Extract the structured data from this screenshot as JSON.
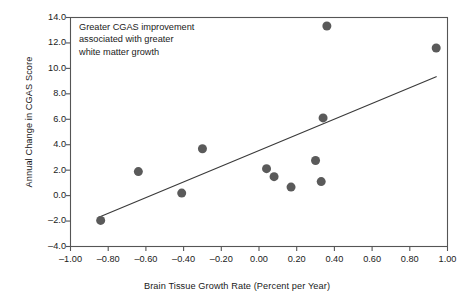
{
  "chart_data": {
    "type": "scatter",
    "title": "",
    "xlabel": "Brain Tissue Growth Rate (Percent per Year)",
    "ylabel": "Annual Change in CGAS Score",
    "xlim": [
      -1.0,
      1.0
    ],
    "ylim": [
      -4.0,
      14.0
    ],
    "xticks": [
      "-1.00",
      "-0.80",
      "-0.60",
      "-0.40",
      "-0.20",
      "0.00",
      "0.20",
      "0.40",
      "0.60",
      "0.80",
      "1.00"
    ],
    "xtick_values": [
      -1.0,
      -0.8,
      -0.6,
      -0.4,
      -0.2,
      0.0,
      0.2,
      0.4,
      0.6,
      0.8,
      1.0
    ],
    "yticks": [
      "-4.0",
      "-2.0",
      "0.0",
      "2.0",
      "4.0",
      "6.0",
      "8.0",
      "10.0",
      "12.0",
      "14.0"
    ],
    "ytick_values": [
      -4.0,
      -2.0,
      0.0,
      2.0,
      4.0,
      6.0,
      8.0,
      10.0,
      12.0,
      14.0
    ],
    "grid": false,
    "legend": false,
    "annotation": "Greater CGAS improvement\nassociated with greater\nwhite matter growth",
    "marker_color": "#5a5a5a",
    "marker_size": 9,
    "line_color": "#3a3a3a",
    "axis_color": "#555555",
    "points": [
      {
        "x": -0.84,
        "y": -1.95
      },
      {
        "x": -0.64,
        "y": 1.89
      },
      {
        "x": -0.41,
        "y": 0.2
      },
      {
        "x": -0.3,
        "y": 3.68
      },
      {
        "x": 0.04,
        "y": 2.12
      },
      {
        "x": 0.08,
        "y": 1.49
      },
      {
        "x": 0.17,
        "y": 0.67
      },
      {
        "x": 0.3,
        "y": 2.76
      },
      {
        "x": 0.33,
        "y": 1.1
      },
      {
        "x": 0.34,
        "y": 6.11
      },
      {
        "x": 0.36,
        "y": 13.33
      },
      {
        "x": 0.94,
        "y": 11.6
      }
    ],
    "trendline": {
      "x_start": -0.85,
      "y_start": -1.7,
      "x_end": 0.94,
      "y_end": 9.35
    }
  }
}
